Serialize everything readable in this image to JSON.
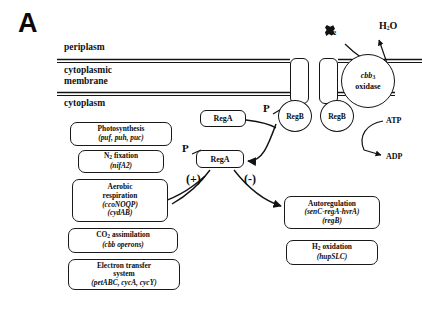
{
  "figure": {
    "panel_label": "A"
  },
  "compartments": [
    {
      "name": "periplasm",
      "label": "periplasm"
    },
    {
      "name": "cytoplasmic-membrane",
      "label": "cytoplasmic\nmembrane"
    },
    {
      "name": "cytoplasm",
      "label": "cytoplasm"
    }
  ],
  "membrane": {
    "oxidase": {
      "name": "cbb3",
      "line1": "cbb",
      "sub": "3",
      "line2": "oxidase"
    },
    "helices": [
      "transmembrane-helix-1",
      "transmembrane-helix-2"
    ],
    "sensors": [
      {
        "label": "RegB"
      },
      {
        "label": "RegB"
      }
    ]
  },
  "molecules": {
    "oxygen": {
      "text": "O",
      "sub": "2"
    },
    "water": {
      "text": "H",
      "sub": "2",
      "tail": "O"
    },
    "atp": "ATP",
    "adp": "ADP",
    "phosphate_on_regb": "P",
    "phosphate_on_rega": "P"
  },
  "regulators": {
    "rega_unphosphorylated": "RegA",
    "rega_phosphorylated": "RegA"
  },
  "signs": {
    "activation": "(+)",
    "repression": "(-)"
  },
  "targets_activated": [
    {
      "name": "photosynthesis",
      "title": "Photosynthesis",
      "genes": "(puf, puh, puc)"
    },
    {
      "name": "n2-fixation",
      "title_pre": "N",
      "title_sub": "2",
      "title_post": " fixation",
      "genes": "(nifA2)"
    },
    {
      "name": "aerobic-respiration",
      "title": "Aerobic",
      "title2": "respiration",
      "genes": "(ccoNOQP)",
      "genes2": "(cydAB)"
    },
    {
      "name": "co2-assimilation",
      "title_pre": "CO",
      "title_sub": "2",
      "title_post": "  assimilation",
      "genes": "(cbb  operons)"
    },
    {
      "name": "electron-transfer-system",
      "title": "Electron transfer",
      "title2": "system",
      "genes": "(petABC, cycA, cycY)"
    }
  ],
  "targets_repressed": [
    {
      "name": "autoregulation",
      "title": "Autoregulation",
      "genes": "(senC-regA-hvrA)",
      "genes2": "(regB)"
    },
    {
      "name": "h2-oxidation",
      "title_pre": "H",
      "title_sub": "2",
      "title_post": "  oxidation",
      "genes": "(hupSLC)"
    }
  ],
  "colors": {
    "ink": "#111111",
    "background": "#ffffff"
  }
}
